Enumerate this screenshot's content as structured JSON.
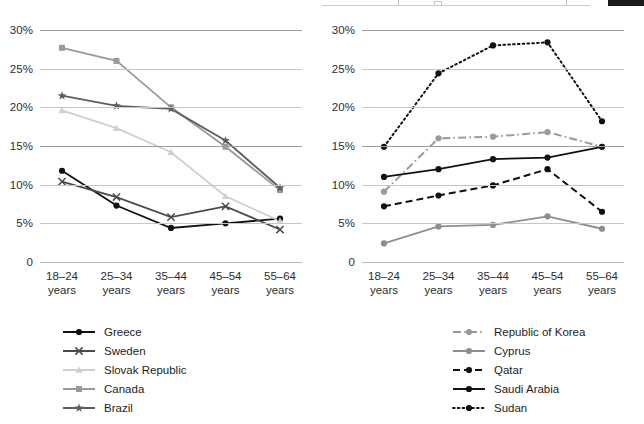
{
  "chrome": {
    "dark_badge_color": "#1b1b1b",
    "rule_color": "#c9ccd1"
  },
  "axis": {
    "categories": [
      "18–24\nyears",
      "25–34\nyears",
      "35–44\nyears",
      "45–54\nyears",
      "55–64\nyears"
    ],
    "category_line1": [
      "18–24",
      "25–34",
      "35–44",
      "45–54",
      "55–64"
    ],
    "category_line2": [
      "years",
      "years",
      "years",
      "years",
      "years"
    ],
    "yticks": [
      "0",
      "5%",
      "10%",
      "15%",
      "20%",
      "25%",
      "30%"
    ],
    "ymin": 0,
    "ymax": 30
  },
  "chart_data": [
    {
      "type": "line",
      "panel": "left",
      "title": "",
      "xlabel": "",
      "ylabel": "",
      "ylim": [
        0,
        30
      ],
      "grid": true,
      "legend_position": "bottom",
      "categories": [
        "18–24 years",
        "25–34 years",
        "35–44 years",
        "45–54 years",
        "55–64 years"
      ],
      "series": [
        {
          "name": "Greece",
          "values": [
            11.8,
            7.3,
            4.4,
            5.0,
            5.6
          ],
          "color": "#111111",
          "marker": "circle",
          "dash": "solid"
        },
        {
          "name": "Sweden",
          "values": [
            10.4,
            8.4,
            5.8,
            7.2,
            4.2
          ],
          "color": "#4a4a4a",
          "marker": "cross",
          "dash": "solid"
        },
        {
          "name": "Slovak Republic",
          "values": [
            19.6,
            17.3,
            14.2,
            8.5,
            5.3
          ],
          "color": "#cfcfcf",
          "marker": "triangle",
          "dash": "solid"
        },
        {
          "name": "Canada",
          "values": [
            27.7,
            26.0,
            20.0,
            14.9,
            9.3
          ],
          "color": "#9a9a9a",
          "marker": "square",
          "dash": "solid"
        },
        {
          "name": "Brazil",
          "values": [
            21.5,
            20.2,
            19.8,
            15.7,
            9.6
          ],
          "color": "#5e5e5e",
          "marker": "star",
          "dash": "solid"
        }
      ]
    },
    {
      "type": "line",
      "panel": "right",
      "title": "",
      "xlabel": "",
      "ylabel": "",
      "ylim": [
        0,
        30
      ],
      "grid": true,
      "legend_position": "bottom",
      "categories": [
        "18–24 years",
        "25–34 years",
        "35–44 years",
        "45–54 years",
        "55–64 years"
      ],
      "series": [
        {
          "name": "Republic of Korea",
          "values": [
            9.1,
            16.0,
            16.2,
            16.8,
            14.9
          ],
          "color": "#9a9a9a",
          "marker": "circle",
          "dash": "dashdot"
        },
        {
          "name": "Cyprus",
          "values": [
            2.4,
            4.6,
            4.8,
            5.9,
            4.3
          ],
          "color": "#8e8e8e",
          "marker": "circle",
          "dash": "solid"
        },
        {
          "name": "Qatar",
          "values": [
            7.2,
            8.6,
            9.9,
            12.0,
            6.5
          ],
          "color": "#111111",
          "marker": "circle",
          "dash": "dashed"
        },
        {
          "name": "Saudi Arabia",
          "values": [
            11.0,
            12.0,
            13.3,
            13.5,
            14.9
          ],
          "color": "#111111",
          "marker": "circle",
          "dash": "solid"
        },
        {
          "name": "Sudan",
          "values": [
            14.9,
            24.4,
            28.0,
            28.4,
            18.2
          ],
          "color": "#111111",
          "marker": "circle",
          "dash": "dotted"
        }
      ]
    }
  ],
  "legends": {
    "left": [
      "Greece",
      "Sweden",
      "Slovak Republic",
      "Canada",
      "Brazil"
    ],
    "right": [
      "Republic of Korea",
      "Cyprus",
      "Qatar",
      "Saudi Arabia",
      "Sudan"
    ]
  }
}
